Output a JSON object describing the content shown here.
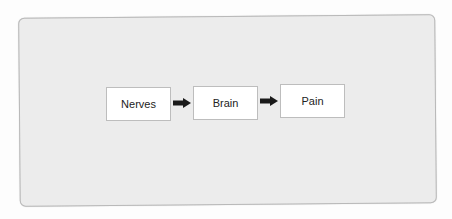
{
  "diagram": {
    "type": "flowchart",
    "nodes": [
      {
        "id": "nerves",
        "label": "Nerves"
      },
      {
        "id": "brain",
        "label": "Brain"
      },
      {
        "id": "pain",
        "label": "Pain"
      }
    ],
    "edges": [
      {
        "from": "nerves",
        "to": "brain"
      },
      {
        "from": "brain",
        "to": "pain"
      }
    ]
  },
  "colors": {
    "panel_bg": "#ececec",
    "node_bg": "#ffffff",
    "arrow": "#1a1a1a"
  }
}
